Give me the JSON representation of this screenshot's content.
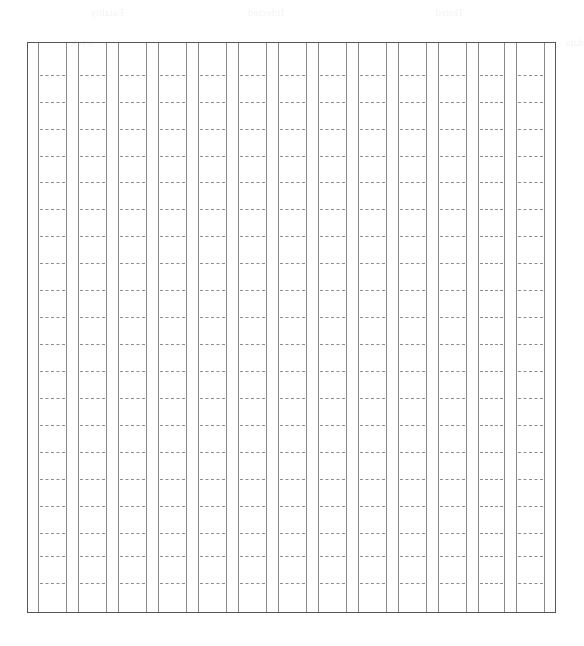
{
  "page": {
    "type": "blank ruled grid worksheet",
    "width": 584,
    "height": 646
  },
  "grid": {
    "frame": {
      "left": 27,
      "top": 42,
      "right": 556,
      "bottom": 613
    },
    "border_color": "#555555",
    "column_line_color": "#8a8a8a",
    "dash_color": "#8e8e8e",
    "column_pairs": [
      [
        38,
        66
      ],
      [
        78,
        106
      ],
      [
        118,
        146
      ],
      [
        158,
        186
      ],
      [
        198,
        226
      ],
      [
        238,
        266
      ],
      [
        278,
        306
      ],
      [
        318,
        346
      ],
      [
        358,
        386
      ],
      [
        398,
        426
      ],
      [
        438,
        466
      ],
      [
        478,
        504
      ],
      [
        516,
        544
      ]
    ],
    "dash_rows_y": [
      75,
      102,
      129,
      156,
      182,
      209,
      236,
      263,
      290,
      317,
      344,
      371,
      398,
      425,
      452,
      479,
      506,
      533,
      556,
      583
    ],
    "cells_content": "empty"
  },
  "bleed_through": {
    "legible": false,
    "lines": [
      {
        "x": 120,
        "y": 6,
        "text": "Tested"
      },
      {
        "x": 300,
        "y": 6,
        "text": "Infected"
      },
      {
        "x": 460,
        "y": 6,
        "text": "Fatality"
      },
      {
        "x": 0,
        "y": 36,
        "text": "data"
      },
      {
        "x": 490,
        "y": 36,
        "text": "week"
      }
    ]
  }
}
